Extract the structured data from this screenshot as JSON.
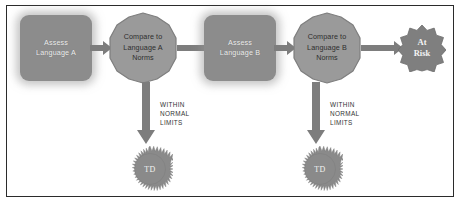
{
  "diagram": {
    "background_color": "#ffffff",
    "frame_color": "#2b2b2b",
    "node_fill_gray": "#8c8c8c",
    "poly_fill_gray": "#9a9a9a",
    "arrow_color": "#7d7d7d",
    "star_fill_gray": "#8a8a8a",
    "seal_fill_gray": "#7f7f7f",
    "nodes": {
      "assess_a": {
        "line1": "Assess",
        "line2": "Language A",
        "shape": "rounded-rectangle"
      },
      "compare_a": {
        "line1": "Compare to",
        "line2": "Language A",
        "line3": "Norms",
        "shape": "rounded-polygon"
      },
      "assess_b": {
        "line1": "Assess",
        "line2": "Language B",
        "shape": "rounded-rectangle"
      },
      "compare_b": {
        "line1": "Compare to",
        "line2": "Language B",
        "line3": "Norms",
        "shape": "rounded-polygon"
      },
      "at_risk": {
        "line1": "At",
        "line2": "Risk",
        "shape": "12-point-seal"
      },
      "td_a": {
        "label": "TD",
        "shape": "starburst"
      },
      "td_b": {
        "label": "TD",
        "shape": "starburst"
      }
    },
    "edge_labels": {
      "within_normal_limits_a": "WITHIN\nNORMAL\nLIMITS",
      "within_normal_limits_b": "WITHIN\nNORMAL\nLIMITS"
    }
  }
}
